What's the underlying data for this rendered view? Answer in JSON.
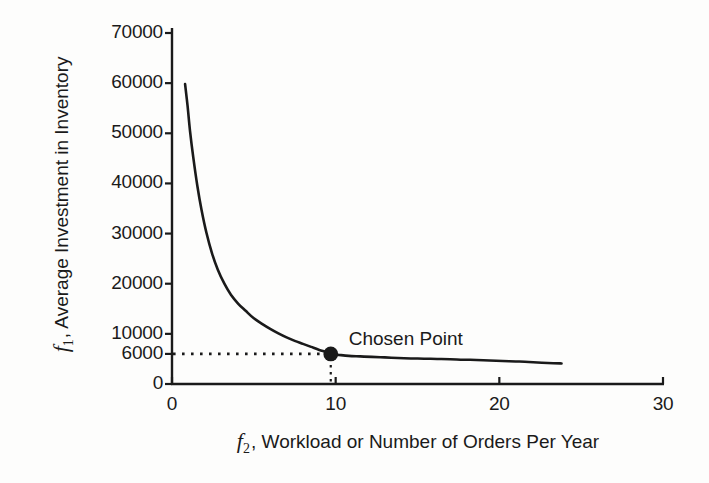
{
  "chart_data": {
    "type": "line",
    "title": "",
    "xlabel": "f2, Workload or Number of Orders Per Year",
    "ylabel": "f1, Average Investment in Inventory",
    "xlabel_var": "f",
    "xlabel_sub": "2",
    "xlabel_rest": ", Workload or Number of Orders Per Year",
    "ylabel_var": "f",
    "ylabel_sub": "1",
    "ylabel_rest": ", Average Investment in Inventory",
    "xlim": [
      0,
      30
    ],
    "ylim": [
      0,
      70000
    ],
    "grid": false,
    "legend": false,
    "xticks": [
      0,
      10,
      20,
      30
    ],
    "xtick_labels": [
      "0",
      "10",
      "20",
      "30"
    ],
    "yticks": [
      0,
      6000,
      10000,
      20000,
      30000,
      40000,
      50000,
      60000,
      70000
    ],
    "ytick_labels": [
      "0",
      "6000",
      "10000",
      "20000",
      "30000",
      "40000",
      "50000",
      "60000",
      "70000"
    ],
    "series": [
      {
        "name": "Pareto front",
        "type": "line",
        "color": "#1a1a1a",
        "x": [
          0.8,
          0.95,
          1.1,
          1.3,
          1.55,
          1.8,
          2.1,
          2.45,
          2.8,
          3.2,
          3.6,
          4.05,
          4.5,
          5.0,
          5.5,
          6.0,
          6.5,
          7.0,
          7.5,
          8.0,
          8.5,
          9.0,
          9.4,
          9.7,
          10.2,
          10.8,
          11.5,
          12.2,
          13.0,
          13.8,
          14.6,
          15.4,
          16.2,
          17.0,
          17.8,
          18.6,
          19.4,
          20.2,
          21.0,
          21.8,
          22.6,
          23.3,
          23.8
        ],
        "y": [
          59800,
          55500,
          50500,
          45200,
          39500,
          34800,
          30200,
          26000,
          22800,
          20000,
          17800,
          16000,
          14600,
          13100,
          12000,
          11000,
          10100,
          9300,
          8600,
          8000,
          7400,
          6800,
          6400,
          6000,
          5800,
          5600,
          5500,
          5400,
          5300,
          5200,
          5100,
          5050,
          5000,
          4950,
          4850,
          4800,
          4700,
          4600,
          4500,
          4400,
          4250,
          4150,
          4100
        ]
      }
    ],
    "annotations": [
      {
        "name": "chosen-point",
        "label": "Chosen Point",
        "x": 9.7,
        "y": 6000,
        "marker": "filled-circle",
        "marker_color": "#1a1a1a",
        "guide_h": true,
        "guide_v": true,
        "guide_style": "dotted"
      }
    ],
    "colors": {
      "line": "#1a1a1a",
      "axis": "#1a1a1a",
      "background": "#fdfdfc",
      "marker": "#1a1a1a"
    }
  }
}
